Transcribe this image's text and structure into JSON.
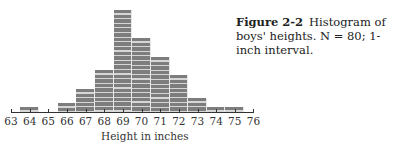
{
  "caption": {
    "figure_label": "Figure",
    "figure_number": "2-2",
    "text": "Histogram of boys' heights. N = 80; 1-inch interval."
  },
  "chart_data": {
    "type": "bar",
    "xlabel": "Height in inches",
    "ylabel": "",
    "categories": [
      "63",
      "64",
      "65",
      "66",
      "67",
      "68",
      "69",
      "70",
      "71",
      "72",
      "73",
      "74",
      "75",
      "76"
    ],
    "values": [
      0,
      1,
      0,
      2,
      5,
      9,
      22,
      16,
      12,
      8,
      3,
      1,
      1,
      0
    ],
    "x_ticks": [
      "63",
      "64",
      "65",
      "66",
      "67",
      "68",
      "69",
      "70",
      "71",
      "72",
      "73",
      "74",
      "75",
      "76"
    ],
    "n": 80,
    "interval": "1-inch",
    "grid": false,
    "legend": "none",
    "bar_style": "striped gray, each stripe = 1 case"
  }
}
